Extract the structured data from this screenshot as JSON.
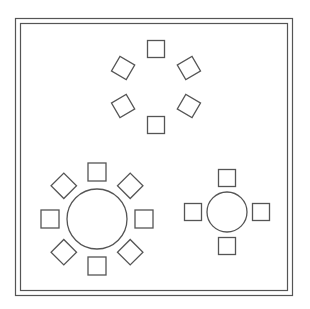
{
  "diagram": {
    "stroke_color": "#555555",
    "background": "#ffffff",
    "groups": [
      {
        "name": "top-group",
        "table": "none",
        "chair_count": 6,
        "chair_orientation": "rotated-to-center"
      },
      {
        "name": "bottom-left-group",
        "table": "round-large",
        "chair_count": 8,
        "chair_orientation": "rotated-to-center"
      },
      {
        "name": "bottom-right-group",
        "table": "round-small",
        "chair_count": 4,
        "chair_orientation": "rotated-to-center"
      }
    ]
  }
}
